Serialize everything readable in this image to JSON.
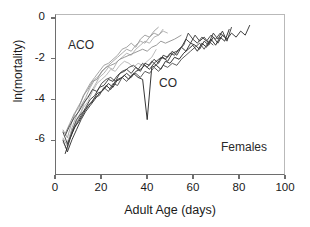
{
  "chart_data": {
    "type": "line",
    "title": "",
    "xlabel": "Adult Age (days)",
    "ylabel": "ln(mortality)",
    "xlim": [
      0,
      100
    ],
    "ylim": [
      -7.7,
      0.2
    ],
    "xticks": [
      0,
      20,
      40,
      60,
      80,
      100
    ],
    "yticks": [
      0,
      -2,
      -4,
      -6
    ],
    "xtick_labels": [
      "0",
      "20",
      "40",
      "60",
      "80",
      "100"
    ],
    "ytick_labels": [
      "0",
      "-2",
      "-4",
      "-6"
    ],
    "grid": false,
    "legend": "none",
    "annotations": [
      {
        "text": "ACO",
        "x": 14,
        "y": -1.2
      },
      {
        "text": "CO",
        "x": 53,
        "y": -3.0
      },
      {
        "text": "Females",
        "x": 82,
        "y": -6.2
      }
    ],
    "series": [
      {
        "name": "ACO-1",
        "group": "ACO",
        "color": "#a0a0a0",
        "x": [
          3,
          5,
          7,
          9,
          11,
          13,
          15,
          17,
          19,
          21,
          23,
          25,
          27,
          29,
          31,
          33,
          35,
          37,
          39,
          41,
          43,
          45,
          47
        ],
        "y": [
          -5.9,
          -6.3,
          -5.4,
          -4.8,
          -4.3,
          -3.9,
          -3.4,
          -3.0,
          -2.8,
          -2.5,
          -2.3,
          -2.1,
          -1.9,
          -1.7,
          -1.5,
          -1.6,
          -1.3,
          -1.1,
          -1.2,
          -0.9,
          -0.7,
          -0.8,
          -0.5
        ]
      },
      {
        "name": "ACO-2",
        "group": "ACO",
        "color": "#9a9a9a",
        "x": [
          3,
          5,
          7,
          9,
          11,
          13,
          15,
          17,
          19,
          21,
          23,
          25,
          27,
          29,
          31,
          33,
          35,
          37,
          39,
          41,
          43,
          45
        ],
        "y": [
          -5.5,
          -5.9,
          -5.1,
          -4.5,
          -4.1,
          -3.6,
          -3.2,
          -2.9,
          -2.6,
          -2.3,
          -2.2,
          -2.0,
          -1.8,
          -1.5,
          -1.4,
          -1.2,
          -1.4,
          -1.0,
          -0.8,
          -0.9,
          -0.6,
          -0.4
        ]
      },
      {
        "name": "ACO-3",
        "group": "ACO",
        "color": "#ababab",
        "x": [
          3,
          5,
          7,
          9,
          11,
          13,
          15,
          17,
          19,
          21,
          23,
          25,
          27,
          29,
          31,
          33,
          35,
          37,
          39,
          41,
          43,
          45,
          47,
          49
        ],
        "y": [
          -6.1,
          -6.5,
          -5.6,
          -5.0,
          -4.6,
          -4.0,
          -3.7,
          -3.3,
          -2.9,
          -2.7,
          -2.4,
          -2.5,
          -2.1,
          -1.9,
          -1.7,
          -1.8,
          -1.5,
          -1.3,
          -1.1,
          -1.2,
          -0.9,
          -0.8,
          -0.6,
          -0.7
        ]
      },
      {
        "name": "ACO-4",
        "group": "ACO",
        "color": "#8f8f8f",
        "x": [
          4,
          6,
          8,
          10,
          12,
          14,
          16,
          18,
          20,
          22,
          24,
          26,
          28,
          30,
          32,
          34,
          36,
          38,
          40,
          42,
          44,
          46,
          48,
          52,
          55
        ],
        "y": [
          -5.7,
          -5.2,
          -4.7,
          -4.4,
          -3.8,
          -3.5,
          -3.1,
          -3.0,
          -2.6,
          -2.4,
          -2.3,
          -2.2,
          -2.0,
          -1.9,
          -1.8,
          -1.7,
          -1.6,
          -1.5,
          -1.6,
          -1.4,
          -1.3,
          -1.1,
          -1.2,
          -1.0,
          -0.8
        ]
      },
      {
        "name": "ACO-5",
        "group": "ACO",
        "color": "#b4b4b4",
        "x": [
          4,
          6,
          8,
          10,
          12,
          14,
          16,
          18,
          20,
          22,
          24,
          26,
          28,
          30,
          32,
          34,
          36,
          38,
          40,
          42,
          44
        ],
        "y": [
          -6.4,
          -5.8,
          -5.3,
          -4.9,
          -4.4,
          -4.1,
          -3.6,
          -3.2,
          -3.0,
          -2.8,
          -2.5,
          -2.6,
          -2.3,
          -2.1,
          -2.2,
          -2.4,
          -2.2,
          -2.3,
          -2.1,
          -1.9,
          -1.5
        ]
      },
      {
        "name": "CO-1",
        "group": "CO",
        "color": "#2a2a2a",
        "x": [
          3,
          5,
          7,
          9,
          11,
          13,
          15,
          17,
          19,
          21,
          23,
          25,
          27,
          29,
          31,
          33,
          35,
          37,
          39,
          41,
          43,
          45,
          47,
          49,
          51,
          53,
          55,
          57,
          59,
          61,
          63,
          65,
          67,
          69,
          71,
          73,
          75,
          77,
          79,
          81,
          83,
          85
        ],
        "y": [
          -6.0,
          -6.6,
          -6.0,
          -5.5,
          -5.0,
          -4.6,
          -4.3,
          -4.0,
          -3.7,
          -3.5,
          -3.2,
          -3.4,
          -3.0,
          -2.9,
          -2.7,
          -2.9,
          -2.6,
          -2.5,
          -2.3,
          -2.5,
          -2.2,
          -2.0,
          -1.9,
          -2.1,
          -1.7,
          -1.6,
          -1.4,
          -1.6,
          -1.2,
          -1.3,
          -1.5,
          -1.1,
          -1.3,
          -0.9,
          -1.2,
          -0.8,
          -1.0,
          -0.7,
          -0.9,
          -0.6,
          -0.8,
          -0.3
        ]
      },
      {
        "name": "CO-2",
        "group": "CO",
        "color": "#333333",
        "x": [
          3,
          5,
          7,
          9,
          11,
          13,
          15,
          17,
          19,
          21,
          23,
          25,
          27,
          29,
          31,
          33,
          35,
          37,
          39,
          41,
          43,
          45,
          47,
          49,
          51,
          53,
          55,
          57,
          59,
          61,
          63,
          65,
          67,
          69,
          71,
          73,
          75,
          77
        ],
        "y": [
          -5.6,
          -6.2,
          -5.7,
          -5.2,
          -4.8,
          -4.4,
          -4.0,
          -3.8,
          -3.4,
          -3.3,
          -3.0,
          -3.1,
          -2.8,
          -2.6,
          -2.5,
          -2.7,
          -2.4,
          -2.6,
          -2.2,
          -2.3,
          -2.0,
          -2.2,
          -1.8,
          -1.9,
          -1.6,
          -1.8,
          -1.4,
          -1.0,
          -1.2,
          -0.8,
          -1.1,
          -0.9,
          -1.2,
          -0.7,
          -1.0,
          -0.6,
          -1.1,
          -0.4
        ]
      },
      {
        "name": "CO-3",
        "group": "CO",
        "color": "#1f1f1f",
        "x": [
          4,
          6,
          8,
          10,
          12,
          14,
          16,
          18,
          20,
          22,
          24,
          26,
          28,
          30,
          32,
          34,
          36,
          38,
          40,
          42,
          44,
          46,
          48,
          50,
          52,
          54,
          56,
          58,
          60,
          62,
          64,
          66,
          68,
          70,
          72,
          74,
          76
        ],
        "y": [
          -6.7,
          -6.0,
          -5.4,
          -5.1,
          -4.7,
          -4.3,
          -4.1,
          -3.7,
          -3.6,
          -3.3,
          -3.5,
          -3.1,
          -3.0,
          -2.8,
          -3.0,
          -2.7,
          -2.9,
          -3.0,
          -5.0,
          -2.4,
          -2.3,
          -2.5,
          -2.1,
          -2.2,
          -1.9,
          -2.0,
          -1.7,
          -1.5,
          -1.3,
          -1.6,
          -1.2,
          -1.4,
          -1.0,
          -1.3,
          -0.9,
          -1.1,
          -0.5
        ]
      },
      {
        "name": "CO-4",
        "group": "CO",
        "color": "#3b3b3b",
        "x": [
          4,
          6,
          8,
          10,
          12,
          14,
          16,
          18,
          20,
          22,
          24,
          26,
          28,
          30,
          32,
          34,
          36,
          38,
          40,
          42,
          44,
          46,
          48,
          50,
          52,
          54,
          56,
          58,
          60,
          62,
          64,
          66,
          68,
          70,
          72,
          74
        ],
        "y": [
          -5.8,
          -5.3,
          -4.9,
          -4.6,
          -4.2,
          -3.9,
          -3.5,
          -3.6,
          -3.2,
          -3.0,
          -2.9,
          -3.1,
          -2.7,
          -2.6,
          -2.4,
          -2.3,
          -2.5,
          -2.2,
          -2.4,
          -2.1,
          -2.3,
          -1.9,
          -2.0,
          -1.7,
          -1.8,
          -1.5,
          -1.3,
          -0.7,
          -1.0,
          -1.2,
          -0.9,
          -1.1,
          -0.8,
          -1.0,
          -0.7,
          -0.9
        ]
      },
      {
        "name": "CO-5",
        "group": "CO",
        "color": "#4a4a4a",
        "x": [
          5,
          7,
          9,
          11,
          13,
          15,
          17,
          19,
          21,
          23,
          25,
          27,
          29,
          31,
          33,
          35,
          37,
          39,
          41,
          43,
          45,
          47,
          49,
          51,
          53,
          55,
          57,
          59,
          61,
          63,
          65,
          67,
          69
        ],
        "y": [
          -6.3,
          -5.6,
          -5.0,
          -4.7,
          -4.5,
          -4.2,
          -3.9,
          -3.8,
          -3.4,
          -3.6,
          -3.2,
          -3.3,
          -2.9,
          -3.1,
          -2.8,
          -2.7,
          -2.9,
          -2.6,
          -2.7,
          -2.4,
          -2.6,
          -2.3,
          -2.4,
          -2.2,
          -2.3,
          -2.0,
          -1.8,
          -1.6,
          -1.4,
          -1.2,
          -1.5,
          -1.1,
          -1.3
        ]
      }
    ]
  }
}
